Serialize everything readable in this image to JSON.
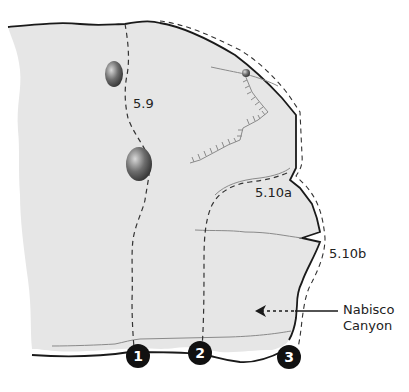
{
  "diagram": {
    "colors": {
      "rock_face": "#e6e6e6",
      "outline": "#1a1a1a",
      "route_line": "#333333",
      "crack": "#8a8a8a",
      "marker_bg": "#111111",
      "marker_text": "#ffffff"
    },
    "grades": [
      {
        "label": "5.9"
      },
      {
        "label": "5.10a"
      },
      {
        "label": "5.10b"
      }
    ],
    "routes": [
      {
        "number": "1"
      },
      {
        "number": "2"
      },
      {
        "number": "3"
      }
    ],
    "callout": {
      "line1": "Nabisco",
      "line2": "Canyon"
    },
    "features": {
      "pockets": [
        "hueco-upper",
        "hueco-lower",
        "small-hueco-right"
      ],
      "overhang": "roof-edge-hatched"
    }
  }
}
